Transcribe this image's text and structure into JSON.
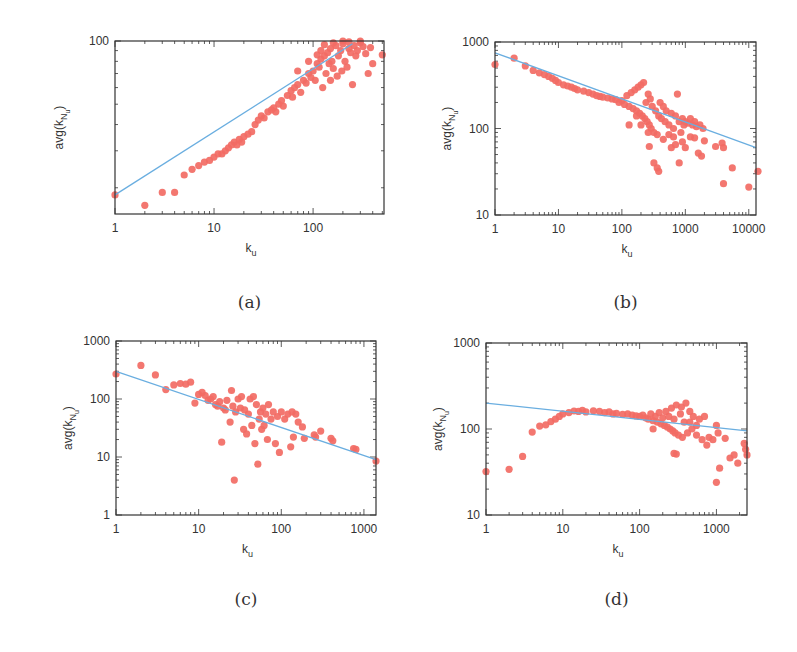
{
  "colors": {
    "points": "#f26b64",
    "fit_line": "#6aaee0",
    "axes": "#333333"
  },
  "chart_data": [
    {
      "id": "a",
      "type": "scatter",
      "caption": "(a)",
      "xlabel": "k_u",
      "ylabel": "avg(k_{N_u})",
      "xscale": "log",
      "yscale": "log",
      "xlim": [
        1,
        520
      ],
      "ylim": [
        15,
        100
      ],
      "xticks": [
        1,
        10,
        100
      ],
      "xtick_labels": [
        "1",
        "10",
        "100"
      ],
      "yticks": [
        100
      ],
      "ytick_labels": [
        "100"
      ],
      "box": {
        "x0": 115,
        "y0": 41,
        "x1": 384,
        "y1": 214
      },
      "fit_line": {
        "x": [
          1,
          250
        ],
        "y": [
          18.5,
          97
        ]
      },
      "points": [
        [
          1,
          18.5
        ],
        [
          2,
          16.5
        ],
        [
          3,
          19
        ],
        [
          4,
          19
        ],
        [
          5,
          23
        ],
        [
          6,
          24.5
        ],
        [
          7,
          25.5
        ],
        [
          8,
          26.5
        ],
        [
          9,
          27
        ],
        [
          10,
          28
        ],
        [
          11,
          29
        ],
        [
          12,
          29
        ],
        [
          13,
          30
        ],
        [
          14,
          31
        ],
        [
          15,
          32
        ],
        [
          16,
          33
        ],
        [
          17,
          32
        ],
        [
          18,
          34
        ],
        [
          19,
          33
        ],
        [
          20,
          35
        ],
        [
          22,
          36
        ],
        [
          24,
          37
        ],
        [
          26,
          40
        ],
        [
          28,
          42
        ],
        [
          30,
          44
        ],
        [
          32,
          43
        ],
        [
          35,
          46
        ],
        [
          38,
          47
        ],
        [
          40,
          48
        ],
        [
          42,
          46
        ],
        [
          45,
          50
        ],
        [
          48,
          52
        ],
        [
          50,
          49
        ],
        [
          55,
          55
        ],
        [
          60,
          58
        ],
        [
          62,
          54
        ],
        [
          65,
          60
        ],
        [
          70,
          62
        ],
        [
          75,
          57
        ],
        [
          80,
          65
        ],
        [
          85,
          63
        ],
        [
          90,
          70
        ],
        [
          95,
          67
        ],
        [
          100,
          72
        ],
        [
          105,
          65
        ],
        [
          110,
          78
        ],
        [
          115,
          75
        ],
        [
          120,
          82
        ],
        [
          125,
          60
        ],
        [
          130,
          85
        ],
        [
          135,
          70
        ],
        [
          140,
          88
        ],
        [
          145,
          78
        ],
        [
          150,
          92
        ],
        [
          155,
          80
        ],
        [
          160,
          74
        ],
        [
          170,
          95
        ],
        [
          180,
          85
        ],
        [
          190,
          90
        ],
        [
          200,
          97
        ],
        [
          210,
          80
        ],
        [
          220,
          75
        ],
        [
          230,
          92
        ],
        [
          240,
          88
        ],
        [
          250,
          62
        ],
        [
          260,
          95
        ],
        [
          270,
          85
        ],
        [
          280,
          90
        ],
        [
          300,
          98
        ],
        [
          320,
          94
        ],
        [
          340,
          87
        ],
        [
          360,
          70
        ],
        [
          380,
          93
        ],
        [
          400,
          78
        ],
        [
          500,
          86
        ],
        [
          130,
          96
        ],
        [
          160,
          98
        ],
        [
          200,
          100
        ],
        [
          230,
          99
        ],
        [
          300,
          100
        ],
        [
          110,
          86
        ],
        [
          90,
          80
        ],
        [
          70,
          72
        ],
        [
          120,
          90
        ],
        [
          150,
          65
        ],
        [
          175,
          68
        ],
        [
          195,
          72
        ]
      ]
    },
    {
      "id": "b",
      "type": "scatter",
      "caption": "(b)",
      "xlabel": "k_u",
      "ylabel": "avg(k_{N_u})",
      "xscale": "log",
      "yscale": "log",
      "xlim": [
        1,
        13000
      ],
      "ylim": [
        10,
        1000
      ],
      "xticks": [
        1,
        10,
        100,
        1000,
        10000
      ],
      "xtick_labels": [
        "1",
        "10",
        "100",
        "1000",
        "10000"
      ],
      "yticks": [
        10,
        100,
        1000
      ],
      "ytick_labels": [
        "10",
        "100",
        "1000"
      ],
      "box": {
        "x0": 495,
        "y0": 42,
        "x1": 756,
        "y1": 215
      },
      "fit_line": {
        "x": [
          1,
          13000
        ],
        "y": [
          750,
          60
        ]
      },
      "points": [
        [
          1,
          550
        ],
        [
          2,
          650
        ],
        [
          3,
          530
        ],
        [
          4,
          470
        ],
        [
          5,
          440
        ],
        [
          6,
          420
        ],
        [
          7,
          400
        ],
        [
          8,
          380
        ],
        [
          9,
          360
        ],
        [
          10,
          340
        ],
        [
          12,
          320
        ],
        [
          14,
          310
        ],
        [
          16,
          300
        ],
        [
          18,
          290
        ],
        [
          20,
          280
        ],
        [
          25,
          270
        ],
        [
          30,
          260
        ],
        [
          35,
          250
        ],
        [
          40,
          240
        ],
        [
          45,
          235
        ],
        [
          50,
          230
        ],
        [
          60,
          225
        ],
        [
          70,
          220
        ],
        [
          80,
          215
        ],
        [
          90,
          200
        ],
        [
          100,
          210
        ],
        [
          110,
          190
        ],
        [
          120,
          240
        ],
        [
          130,
          180
        ],
        [
          140,
          260
        ],
        [
          150,
          170
        ],
        [
          160,
          280
        ],
        [
          170,
          160
        ],
        [
          180,
          300
        ],
        [
          190,
          150
        ],
        [
          200,
          320
        ],
        [
          210,
          140
        ],
        [
          220,
          340
        ],
        [
          230,
          130
        ],
        [
          240,
          200
        ],
        [
          250,
          120
        ],
        [
          260,
          250
        ],
        [
          270,
          110
        ],
        [
          280,
          220
        ],
        [
          290,
          100
        ],
        [
          300,
          180
        ],
        [
          320,
          90
        ],
        [
          340,
          160
        ],
        [
          360,
          85
        ],
        [
          380,
          140
        ],
        [
          400,
          200
        ],
        [
          420,
          130
        ],
        [
          450,
          180
        ],
        [
          480,
          120
        ],
        [
          500,
          160
        ],
        [
          550,
          110
        ],
        [
          600,
          150
        ],
        [
          650,
          100
        ],
        [
          700,
          140
        ],
        [
          750,
          250
        ],
        [
          800,
          120
        ],
        [
          850,
          90
        ],
        [
          900,
          130
        ],
        [
          950,
          110
        ],
        [
          1000,
          120
        ],
        [
          1100,
          115
        ],
        [
          1200,
          130
        ],
        [
          1300,
          110
        ],
        [
          1400,
          120
        ],
        [
          1500,
          105
        ],
        [
          1700,
          110
        ],
        [
          1900,
          100
        ],
        [
          270,
          62
        ],
        [
          320,
          40
        ],
        [
          360,
          35
        ],
        [
          380,
          32
        ],
        [
          600,
          60
        ],
        [
          700,
          65
        ],
        [
          800,
          40
        ],
        [
          900,
          70
        ],
        [
          1000,
          60
        ],
        [
          1200,
          80
        ],
        [
          1400,
          78
        ],
        [
          1600,
          52
        ],
        [
          1800,
          48
        ],
        [
          2000,
          72
        ],
        [
          3000,
          62
        ],
        [
          3800,
          68
        ],
        [
          4000,
          60
        ],
        [
          4000,
          23
        ],
        [
          5500,
          35
        ],
        [
          10000,
          21
        ],
        [
          14000,
          32
        ],
        [
          130,
          110
        ],
        [
          170,
          140
        ],
        [
          200,
          110
        ],
        [
          260,
          90
        ],
        [
          450,
          75
        ],
        [
          550,
          85
        ],
        [
          650,
          80
        ]
      ]
    },
    {
      "id": "c",
      "type": "scatter",
      "caption": "(c)",
      "xlabel": "k_u",
      "ylabel": "avg(k_{N_u})",
      "xscale": "log",
      "yscale": "log",
      "xlim": [
        1,
        1400
      ],
      "ylim": [
        1,
        1000
      ],
      "xticks": [
        1,
        10,
        100,
        1000
      ],
      "xtick_labels": [
        "1",
        "10",
        "100",
        "1000"
      ],
      "yticks": [
        1,
        10,
        100,
        1000
      ],
      "ytick_labels": [
        "1",
        "10",
        "100",
        "1000"
      ],
      "box": {
        "x0": 116,
        "y0": 341,
        "x1": 376,
        "y1": 515
      },
      "fit_line": {
        "x": [
          1,
          1400
        ],
        "y": [
          300,
          9
        ]
      },
      "points": [
        [
          1,
          270
        ],
        [
          2,
          380
        ],
        [
          3,
          260
        ],
        [
          4,
          145
        ],
        [
          5,
          175
        ],
        [
          6,
          185
        ],
        [
          7,
          180
        ],
        [
          8,
          195
        ],
        [
          9,
          85
        ],
        [
          10,
          120
        ],
        [
          11,
          130
        ],
        [
          12,
          115
        ],
        [
          13,
          95
        ],
        [
          14,
          100
        ],
        [
          15,
          110
        ],
        [
          16,
          80
        ],
        [
          17,
          75
        ],
        [
          18,
          90
        ],
        [
          19,
          18
        ],
        [
          20,
          70
        ],
        [
          21,
          65
        ],
        [
          22,
          95
        ],
        [
          24,
          40
        ],
        [
          25,
          140
        ],
        [
          26,
          75
        ],
        [
          27,
          4
        ],
        [
          28,
          60
        ],
        [
          30,
          100
        ],
        [
          32,
          70
        ],
        [
          33,
          110
        ],
        [
          35,
          30
        ],
        [
          36,
          65
        ],
        [
          38,
          25
        ],
        [
          40,
          55
        ],
        [
          42,
          100
        ],
        [
          44,
          35
        ],
        [
          46,
          110
        ],
        [
          48,
          17
        ],
        [
          50,
          80
        ],
        [
          52,
          7.5
        ],
        [
          54,
          45
        ],
        [
          56,
          60
        ],
        [
          58,
          30
        ],
        [
          60,
          70
        ],
        [
          62,
          35
        ],
        [
          65,
          55
        ],
        [
          68,
          20
        ],
        [
          70,
          80
        ],
        [
          75,
          45
        ],
        [
          80,
          60
        ],
        [
          85,
          17
        ],
        [
          90,
          50
        ],
        [
          95,
          12
        ],
        [
          100,
          60
        ],
        [
          110,
          45
        ],
        [
          120,
          55
        ],
        [
          130,
          15
        ],
        [
          135,
          60
        ],
        [
          140,
          22
        ],
        [
          150,
          55
        ],
        [
          160,
          40
        ],
        [
          180,
          33
        ],
        [
          190,
          21
        ],
        [
          250,
          24
        ],
        [
          260,
          22
        ],
        [
          300,
          28
        ],
        [
          400,
          21
        ],
        [
          420,
          19
        ],
        [
          750,
          14
        ],
        [
          800,
          13.5
        ],
        [
          1400,
          8.5
        ]
      ]
    },
    {
      "id": "d",
      "type": "scatter",
      "caption": "(d)",
      "xlabel": "k_u",
      "ylabel": "avg(k_{N_u})",
      "xscale": "log",
      "yscale": "log",
      "xlim": [
        1,
        2500
      ],
      "ylim": [
        10,
        1000
      ],
      "xticks": [
        1,
        10,
        100,
        1000
      ],
      "xtick_labels": [
        "1",
        "10",
        "100",
        "1000"
      ],
      "yticks": [
        10,
        100,
        1000
      ],
      "ytick_labels": [
        "10",
        "100",
        "1000"
      ],
      "box": {
        "x0": 486,
        "y0": 343,
        "x1": 747,
        "y1": 515
      },
      "fit_line": {
        "x": [
          1,
          2500
        ],
        "y": [
          200,
          95
        ]
      },
      "points": [
        [
          1,
          32
        ],
        [
          2,
          34
        ],
        [
          3,
          48
        ],
        [
          4,
          92
        ],
        [
          5,
          108
        ],
        [
          6,
          112
        ],
        [
          7,
          122
        ],
        [
          8,
          130
        ],
        [
          9,
          140
        ],
        [
          10,
          150
        ],
        [
          12,
          155
        ],
        [
          14,
          162
        ],
        [
          16,
          160
        ],
        [
          18,
          165
        ],
        [
          20,
          158
        ],
        [
          25,
          163
        ],
        [
          30,
          160
        ],
        [
          35,
          155
        ],
        [
          40,
          158
        ],
        [
          45,
          150
        ],
        [
          50,
          152
        ],
        [
          60,
          148
        ],
        [
          70,
          150
        ],
        [
          80,
          145
        ],
        [
          90,
          142
        ],
        [
          100,
          140
        ],
        [
          110,
          145
        ],
        [
          120,
          135
        ],
        [
          130,
          130
        ],
        [
          140,
          150
        ],
        [
          150,
          125
        ],
        [
          160,
          140
        ],
        [
          170,
          120
        ],
        [
          180,
          155
        ],
        [
          190,
          115
        ],
        [
          200,
          135
        ],
        [
          210,
          110
        ],
        [
          220,
          160
        ],
        [
          230,
          105
        ],
        [
          240,
          140
        ],
        [
          250,
          100
        ],
        [
          260,
          175
        ],
        [
          270,
          95
        ],
        [
          280,
          130
        ],
        [
          290,
          90
        ],
        [
          300,
          190
        ],
        [
          320,
          85
        ],
        [
          340,
          150
        ],
        [
          360,
          80
        ],
        [
          380,
          120
        ],
        [
          400,
          200
        ],
        [
          420,
          90
        ],
        [
          450,
          160
        ],
        [
          480,
          100
        ],
        [
          500,
          140
        ],
        [
          550,
          85
        ],
        [
          600,
          130
        ],
        [
          650,
          75
        ],
        [
          700,
          140
        ],
        [
          750,
          65
        ],
        [
          800,
          80
        ],
        [
          900,
          75
        ],
        [
          1000,
          110
        ],
        [
          1050,
          90
        ],
        [
          280,
          52
        ],
        [
          300,
          51
        ],
        [
          1000,
          24
        ],
        [
          1100,
          35
        ],
        [
          1300,
          78
        ],
        [
          1500,
          46
        ],
        [
          1700,
          50
        ],
        [
          1900,
          40
        ],
        [
          2300,
          68
        ],
        [
          2400,
          58
        ],
        [
          2500,
          50
        ],
        [
          150,
          100
        ],
        [
          350,
          180
        ],
        [
          450,
          120
        ],
        [
          550,
          110
        ]
      ]
    }
  ]
}
